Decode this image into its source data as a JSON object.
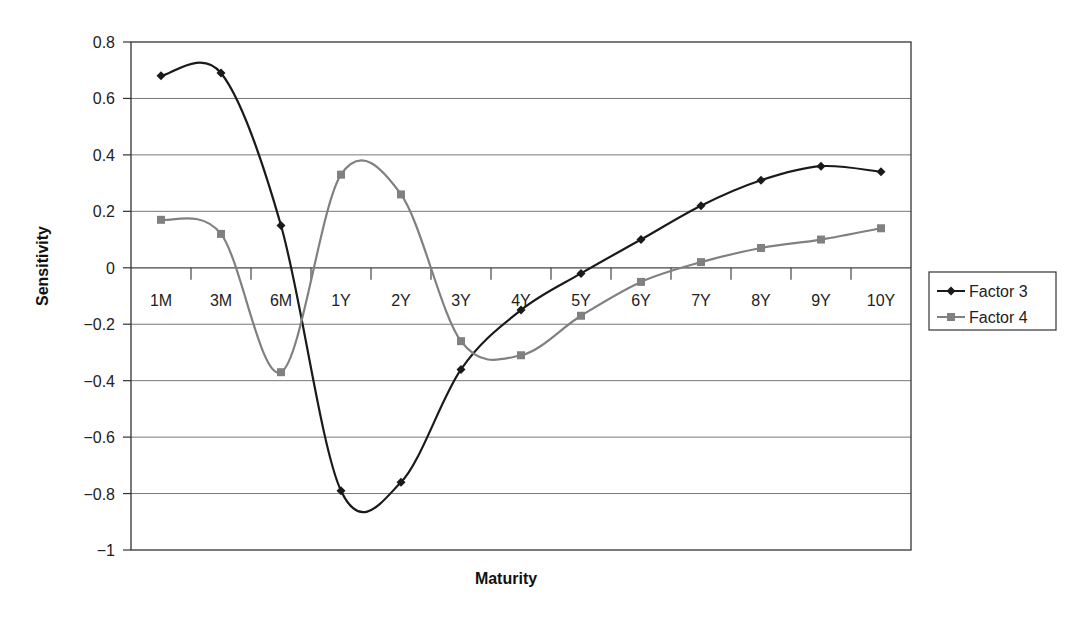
{
  "chart_data": {
    "type": "line",
    "title": "",
    "xlabel": "Maturity",
    "ylabel": "Sensitivity",
    "categories": [
      "1M",
      "3M",
      "6M",
      "1Y",
      "2Y",
      "3Y",
      "4Y",
      "5Y",
      "6Y",
      "7Y",
      "8Y",
      "9Y",
      "10Y"
    ],
    "series": [
      {
        "name": "Factor 3",
        "color": "#1a1a1a",
        "marker": "diamond",
        "values": [
          0.68,
          0.69,
          0.15,
          -0.79,
          -0.76,
          -0.36,
          -0.15,
          -0.02,
          0.1,
          0.22,
          0.31,
          0.36,
          0.34
        ]
      },
      {
        "name": "Factor 4",
        "color": "#808080",
        "marker": "square",
        "values": [
          0.17,
          0.12,
          -0.37,
          0.33,
          0.26,
          -0.26,
          -0.31,
          -0.17,
          -0.05,
          0.02,
          0.07,
          0.1,
          0.14
        ]
      }
    ],
    "ylim": [
      -1,
      0.8
    ],
    "yticks": [
      0.8,
      0.6,
      0.4,
      0.2,
      0,
      -0.2,
      -0.4,
      -0.6,
      -0.8,
      -1
    ],
    "ytick_labels": [
      "0.8",
      "0.6",
      "0.4",
      "0.2",
      "0",
      "−0.2",
      "−0.4",
      "−0.6",
      "−0.8",
      "−1"
    ],
    "grid": true,
    "smoothed": true,
    "legend_position": "right"
  }
}
